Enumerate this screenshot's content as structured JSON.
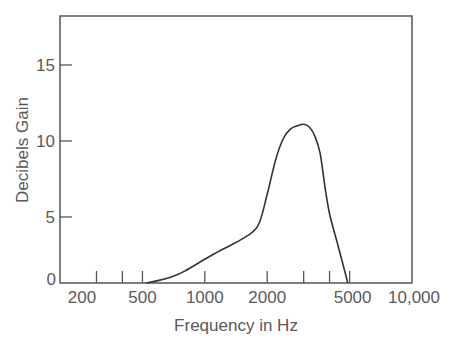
{
  "chart_data": {
    "type": "line",
    "title": "",
    "xlabel": "Frequency in Hz",
    "ylabel": "Decibels Gain",
    "xscale": "log",
    "xlim": [
      200,
      10000
    ],
    "ylim": [
      0,
      18
    ],
    "grid": false,
    "legend": null,
    "x_ticks": [
      {
        "value": 200,
        "label": "200"
      },
      {
        "value": 300,
        "label": ""
      },
      {
        "value": 400,
        "label": ""
      },
      {
        "value": 500,
        "label": "500"
      },
      {
        "value": 1000,
        "label": "1000"
      },
      {
        "value": 2000,
        "label": "2000"
      },
      {
        "value": 3000,
        "label": ""
      },
      {
        "value": 4000,
        "label": ""
      },
      {
        "value": 5000,
        "label": "5000"
      },
      {
        "value": 10000,
        "label": "10,000"
      }
    ],
    "y_ticks": [
      {
        "value": 0,
        "label": "0"
      },
      {
        "value": 5,
        "label": "5"
      },
      {
        "value": 10,
        "label": "10"
      },
      {
        "value": 15,
        "label": "15"
      }
    ],
    "series": [
      {
        "name": "Gain",
        "color": "#333333",
        "x": [
          520,
          600,
          700,
          800,
          1000,
          1200,
          1500,
          1800,
          2000,
          2200,
          2400,
          2600,
          2800,
          3000,
          3200,
          3400,
          3600,
          3800,
          4000,
          4400,
          4900
        ],
        "y": [
          0,
          0.2,
          0.5,
          0.9,
          1.8,
          2.5,
          3.3,
          4.3,
          6.5,
          8.8,
          10.2,
          10.8,
          11.0,
          11.1,
          10.9,
          10.3,
          9.2,
          7.0,
          5.2,
          2.8,
          0
        ]
      }
    ]
  }
}
